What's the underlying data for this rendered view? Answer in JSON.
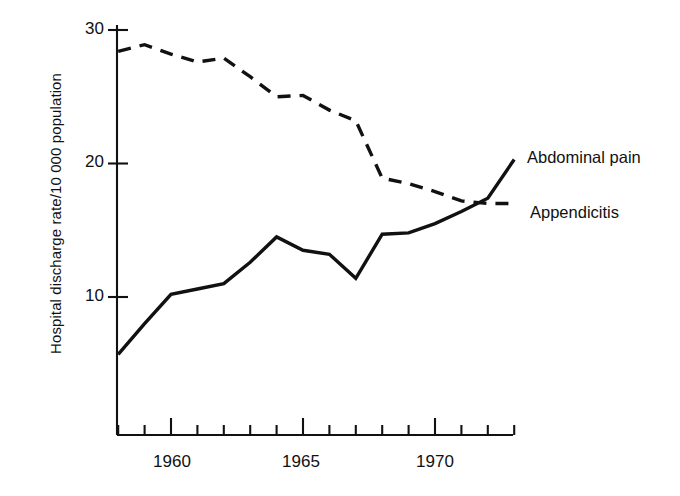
{
  "chart_data": {
    "type": "line",
    "title": "",
    "xlabel": "",
    "ylabel": "Hospital discharge rate/10 000 population",
    "xlim": [
      1957.9,
      1973.0
    ],
    "ylim": [
      0,
      30
    ],
    "grid": false,
    "legend_position": "right-inline-labels",
    "x_tick_labels": [
      "1960",
      "1965",
      "1970"
    ],
    "x_major_ticks": [
      1960,
      1965,
      1970
    ],
    "x_minor_ticks": [
      1958,
      1959,
      1961,
      1962,
      1963,
      1964,
      1966,
      1967,
      1968,
      1969,
      1971,
      1972,
      1973
    ],
    "y_tick_labels": [
      "10",
      "20",
      "30"
    ],
    "y_ticks": [
      10,
      20,
      30
    ],
    "x": [
      1958,
      1959,
      1960,
      1961,
      1962,
      1963,
      1964,
      1965,
      1966,
      1967,
      1968,
      1969,
      1970,
      1971,
      1972,
      1973
    ],
    "series": [
      {
        "name": "Abdominal pain",
        "style": "solid",
        "color": "#111111",
        "values": [
          5.7,
          8.0,
          10.2,
          10.6,
          11.0,
          12.6,
          14.5,
          13.5,
          13.2,
          11.4,
          14.7,
          14.8,
          15.5,
          16.4,
          17.4,
          20.3
        ]
      },
      {
        "name": "Appendicitis",
        "style": "dashed",
        "color": "#111111",
        "values": [
          28.4,
          28.9,
          28.2,
          27.6,
          27.9,
          26.5,
          25.0,
          25.1,
          24.0,
          23.2,
          18.9,
          18.5,
          17.9,
          17.2,
          17.0,
          17.0
        ]
      }
    ]
  },
  "axes": {
    "y_title": "Hospital discharge rate/10 000 population",
    "y_labels": {
      "t30": "30",
      "t20": "20",
      "t10": "10"
    },
    "x_labels": {
      "t1960": "1960",
      "t1965": "1965",
      "t1970": "1970"
    }
  },
  "annotations": {
    "abdominal_pain": "Abdominal pain",
    "appendicitis": "Appendicitis"
  }
}
